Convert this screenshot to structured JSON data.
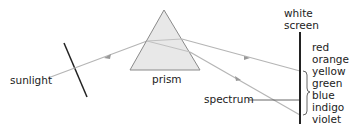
{
  "diagram": {
    "labels": {
      "sunlight": "sunlight",
      "prism": "prism",
      "spectrum": "spectrum",
      "screen_line1": "white",
      "screen_line2": "screen"
    },
    "spectrum_colors": [
      "red",
      "orange",
      "yellow",
      "green",
      "blue",
      "indigo",
      "violet"
    ],
    "colors": {
      "ray": "#b5b5b5",
      "prism_fill": "#e6e6e6",
      "prism_edge": "#8a8a8a",
      "screen": "#222222",
      "text": "#222222"
    }
  }
}
